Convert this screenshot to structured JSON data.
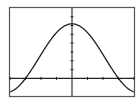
{
  "chart_data": {
    "type": "line",
    "title": "",
    "xlabel": "",
    "ylabel": "",
    "grid": false,
    "legend": null,
    "function": "y = cos(x)",
    "xlim": [
      -4,
      4
    ],
    "ylim": [
      -1,
      4
    ],
    "x_ticks_every": 1,
    "y_ticks_every": 0.5,
    "series": [
      {
        "name": "f(x)",
        "x": [
          -4,
          -3,
          -2.5,
          -2,
          -1.5,
          -1,
          -0.5,
          0,
          0.5,
          1,
          1.5,
          2,
          2.5,
          3,
          4
        ],
        "values": [
          -0.6,
          0.0,
          0.9,
          1.6,
          2.2,
          2.7,
          3.0,
          3.1,
          3.0,
          2.7,
          2.2,
          1.6,
          0.9,
          0.0,
          -0.6
        ]
      }
    ]
  },
  "colors": {
    "background": "#ffffff",
    "frame": "#555555",
    "axes": "#222222",
    "curve": "#222222"
  }
}
